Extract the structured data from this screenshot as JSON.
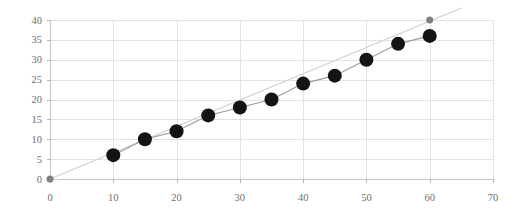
{
  "chart_data": {
    "type": "scatter",
    "title": "",
    "subtitle": "",
    "xlabel": "",
    "ylabel": "",
    "xlim": [
      0,
      70
    ],
    "ylim": [
      0,
      40
    ],
    "xticks": [
      0,
      10,
      20,
      30,
      40,
      50,
      60,
      70
    ],
    "yticks": [
      0,
      5,
      10,
      15,
      20,
      25,
      30,
      35,
      40
    ],
    "xtick_labels": [
      "0",
      "10",
      "20",
      "30",
      "40",
      "50",
      "60",
      "70"
    ],
    "ytick_labels": [
      "0",
      "5",
      "10",
      "15",
      "20",
      "25",
      "30",
      "35",
      "40"
    ],
    "grid": true,
    "grid_color": "#e2e2e2",
    "legend": false,
    "legend_position": "none",
    "background_color": "#ffffff",
    "series": [
      {
        "name": "measured",
        "marker": "circle",
        "marker_size": 7,
        "marker_color": "#141414",
        "line_color": "#9a9a9a",
        "x": [
          10,
          15,
          20,
          25,
          30,
          35,
          40,
          45,
          50,
          55,
          60
        ],
        "y": [
          6,
          10,
          12,
          16,
          18,
          20,
          24,
          26,
          30,
          34,
          36
        ]
      },
      {
        "name": "trend",
        "marker": "circle",
        "marker_size": 3.5,
        "marker_color": "#808080",
        "line_color": "#cfcfcf",
        "x": [
          0,
          60
        ],
        "y": [
          0,
          40
        ],
        "line_extends_to_x": 65,
        "line_extends_to_y": 43
      }
    ]
  }
}
